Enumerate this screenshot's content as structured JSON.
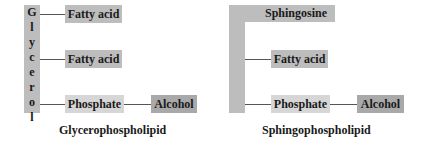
{
  "glycerophospholipid": {
    "backbone_letters": [
      "G",
      "l",
      "y",
      "c",
      "e",
      "r",
      "o",
      "l"
    ],
    "fatty_acid_1": "Fatty acid",
    "fatty_acid_2": "Fatty acid",
    "phosphate": "Phosphate",
    "alcohol": "Alcohol",
    "caption": "Glycerophospholipid"
  },
  "sphingophospholipid": {
    "backbone": "Sphingosine",
    "fatty_acid": "Fatty acid",
    "phosphate": "Phosphate",
    "alcohol": "Alcohol",
    "caption": "Sphingophospholipid"
  },
  "colors": {
    "backbone": "#bdbdbd",
    "fatty_acid": "#bdbdbd",
    "phosphate": "#d6d6d6",
    "alcohol": "#a9a9a9",
    "connector": "#555555"
  }
}
